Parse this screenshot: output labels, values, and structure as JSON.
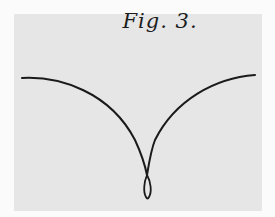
{
  "figure": {
    "label": "Fig. 3.",
    "stroke_color": "#1a1a1a",
    "background_color": "#e6e6e6"
  }
}
